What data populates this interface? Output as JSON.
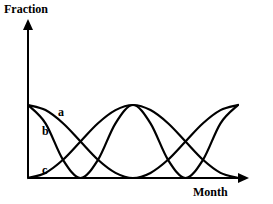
{
  "chart_data": {
    "type": "line",
    "title": "",
    "ylabel": "Fraction",
    "xlabel": "Month",
    "xlim": [
      0,
      12
    ],
    "ylim": [
      0,
      1.55
    ],
    "grid": false,
    "legend": "inline curve labels",
    "x": [
      0,
      1,
      2,
      3,
      4,
      5,
      6,
      7,
      8,
      9,
      10,
      11,
      12
    ],
    "series": [
      {
        "name": "a",
        "label_position": "near start, top",
        "values": [
          1.0,
          0.93,
          0.75,
          0.5,
          0.25,
          0.07,
          0.0,
          0.07,
          0.25,
          0.5,
          0.75,
          0.93,
          1.0
        ]
      },
      {
        "name": "b",
        "label_position": "near start, below a",
        "values": [
          1.0,
          0.75,
          0.25,
          0.0,
          0.25,
          0.75,
          1.0,
          0.75,
          0.25,
          0.0,
          0.25,
          0.75,
          1.0
        ]
      },
      {
        "name": "c",
        "label_position": "near start, bottom",
        "values": [
          0.0,
          0.07,
          0.25,
          0.5,
          0.75,
          0.93,
          1.0,
          0.93,
          0.75,
          0.5,
          0.25,
          0.07,
          0.0
        ]
      }
    ],
    "annotations": [
      "a",
      "b",
      "c"
    ]
  },
  "labels": {
    "y_axis": "Fraction",
    "x_axis": "Month",
    "curve_a": "a",
    "curve_b": "b",
    "curve_c": "c"
  },
  "colors": {
    "line": "#000000",
    "background": "#ffffff"
  }
}
